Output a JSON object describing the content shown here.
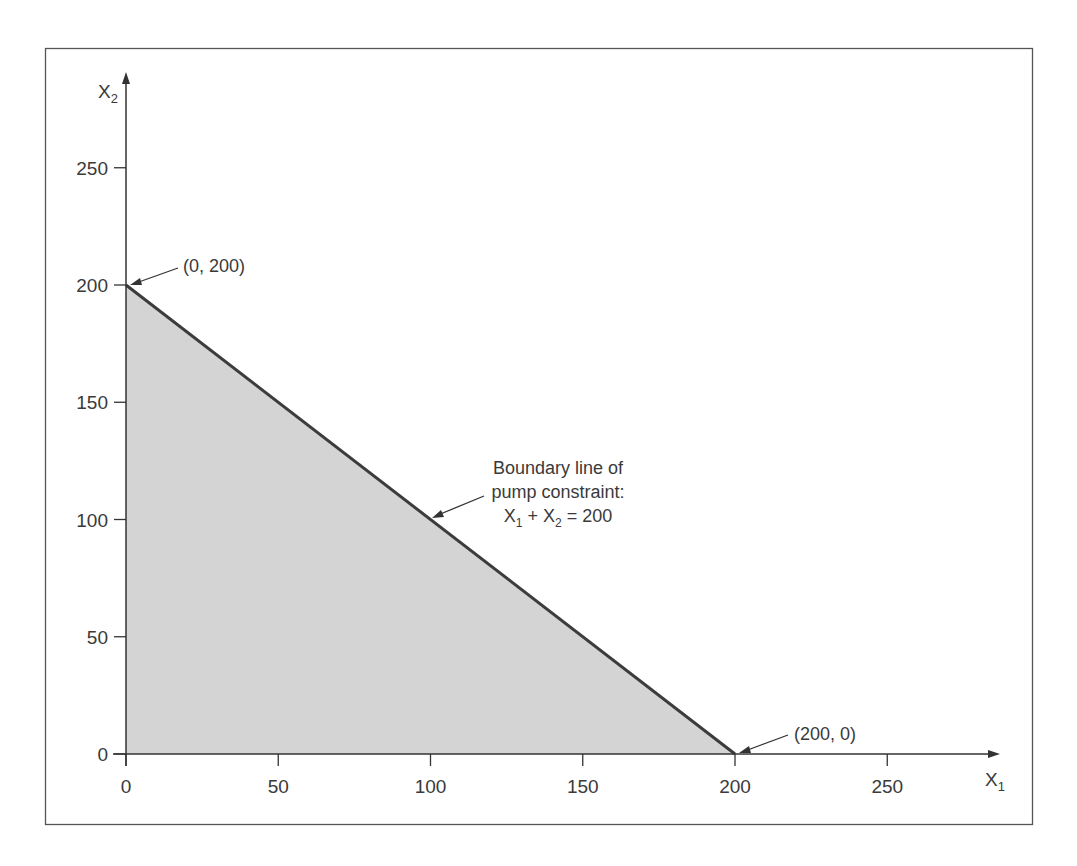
{
  "chart_data": {
    "type": "area",
    "title": "",
    "xlabel": "X1",
    "ylabel": "X2",
    "xlim": [
      0,
      280
    ],
    "ylim": [
      0,
      280
    ],
    "grid": false,
    "x_ticks": [
      0,
      50,
      100,
      150,
      200,
      250
    ],
    "y_ticks": [
      0,
      50,
      100,
      150,
      200,
      250
    ],
    "series": [
      {
        "name": "Boundary line of pump constraint: X1 + X2 = 200",
        "type": "line",
        "x": [
          0,
          200
        ],
        "y": [
          200,
          0
        ]
      },
      {
        "name": "Feasible region",
        "type": "area",
        "polygon": [
          [
            0,
            0
          ],
          [
            0,
            200
          ],
          [
            200,
            0
          ]
        ]
      }
    ],
    "annotations": [
      {
        "text": "(0, 200)",
        "point": [
          0,
          200
        ]
      },
      {
        "text": "(200, 0)",
        "point": [
          200,
          0
        ]
      },
      {
        "text": "Boundary line of pump constraint: X1 + X2 = 200",
        "point": [
          100,
          100
        ]
      }
    ]
  },
  "labels": {
    "x_axis": {
      "main": "X",
      "sub": "1"
    },
    "y_axis": {
      "main": "X",
      "sub": "2"
    },
    "pt_top": "(0, 200)",
    "pt_right": "(200, 0)",
    "boundary_line1": "Boundary line of",
    "boundary_line2": "pump constraint:",
    "eq_x": "X",
    "eq_sub1": "1",
    "eq_plus": " + X",
    "eq_sub2": "2",
    "eq_rhs": " = 200"
  },
  "colors": {
    "fill": "#d4d4d4",
    "line": "#3c3c3c",
    "axis": "#333333",
    "frame": "#555555"
  }
}
